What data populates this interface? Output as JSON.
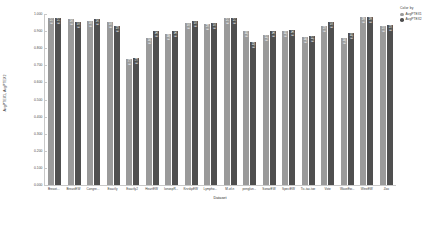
{
  "legend": {
    "title": "Color by",
    "entries": [
      {
        "label": "AvgPTEX1",
        "color": "#9a9a9a"
      },
      {
        "label": "AvgPTEX2",
        "color": "#4f4f4f"
      }
    ]
  },
  "chart_data": {
    "type": "bar",
    "title": "",
    "xlabel": "Dataset",
    "ylabel": "AvgPTEX1, AvgPTEX2",
    "ylim": [
      0.0,
      1.0
    ],
    "yticks": [
      "0.000",
      "0.100",
      "0.200",
      "0.300",
      "0.400",
      "0.500",
      "0.600",
      "0.700",
      "0.800",
      "0.900",
      "1.000"
    ],
    "grid": false,
    "legend_position": "top-right",
    "categories": [
      "Breast...",
      "BreastEW",
      "Congre...",
      "Exactly",
      "Exactly2",
      "HeartEW",
      "IonospR...",
      "KrvskpEW",
      "Lympho...",
      "M-of-n",
      "penglun...",
      "SonarEW",
      "SpectEW",
      "Tic-tac-toe",
      "Vote",
      "WaveEw...",
      "WineEW",
      "Zoo"
    ],
    "series": [
      {
        "name": "AvgPTEX1",
        "color": "#9a9a9a",
        "values": [
          0.975,
          0.968,
          0.958,
          0.955,
          0.738,
          0.86,
          0.885,
          0.95,
          0.94,
          0.975,
          0.898,
          0.878,
          0.898,
          0.868,
          0.93,
          0.862,
          0.985,
          0.928
        ],
        "labels": [
          "0.975",
          "0.968",
          "0.958",
          "0.955",
          "0.738",
          "0.860",
          "0.885",
          "0.950",
          "0.940",
          "0.975",
          "0.898",
          "0.878",
          "0.898",
          "0.868",
          "0.930",
          "0.862",
          "0.985",
          "0.928"
        ]
      },
      {
        "name": "AvgPTEX2",
        "color": "#4f4f4f",
        "values": [
          0.978,
          0.952,
          0.968,
          0.932,
          0.745,
          0.9,
          0.9,
          0.958,
          0.95,
          0.975,
          0.838,
          0.9,
          0.908,
          0.872,
          0.952,
          0.89,
          0.98,
          0.938
        ],
        "labels": [
          "0.978",
          "0.952",
          "0.968",
          "0.932",
          "0.745",
          "0.900",
          "0.900",
          "0.958",
          "0.950",
          "0.975",
          "0.838",
          "0.900",
          "0.908",
          "0.872",
          "0.952",
          "0.890",
          "0.980",
          "0.938"
        ]
      }
    ]
  }
}
